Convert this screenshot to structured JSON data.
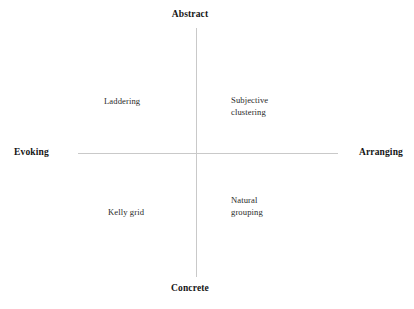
{
  "figure": {
    "type": "quadrant-diagram",
    "background_color": "#ffffff",
    "axis_color": "#c9c9c9",
    "text_color": "#1c1c1c"
  },
  "axes": {
    "vertical": {
      "top_pole_label": "Abstract",
      "bottom_pole_label": "Concrete"
    },
    "horizontal": {
      "left_pole_label": "Evoking",
      "right_pole_label": "Arranging"
    }
  },
  "quadrant_items": [
    {
      "label": "Laddering",
      "quadrant": "top-left"
    },
    {
      "label": "Subjective\nclustering",
      "quadrant": "top-right"
    },
    {
      "label": "Kelly grid",
      "quadrant": "bottom-left"
    },
    {
      "label": "Natural\ngrouping",
      "quadrant": "bottom-right"
    }
  ],
  "chart_data": {
    "type": "scatter",
    "title": "",
    "xlabel": "",
    "ylabel": "",
    "grid": false,
    "legend": null,
    "x_axis": {
      "label_low": "Evoking",
      "label_high": "Arranging",
      "range": [
        -1,
        1
      ],
      "ticks": []
    },
    "y_axis": {
      "label_low": "Concrete",
      "label_high": "Abstract",
      "range": [
        -1,
        1
      ],
      "ticks": []
    },
    "annotations": [
      {
        "text": "Laddering",
        "x": -0.46,
        "y": 0.43
      },
      {
        "text": "Subjective clustering",
        "x": 0.29,
        "y": 0.45
      },
      {
        "text": "Kelly grid",
        "x": -0.41,
        "y": -0.5
      },
      {
        "text": "Natural grouping",
        "x": 0.29,
        "y": -0.4
      }
    ]
  }
}
